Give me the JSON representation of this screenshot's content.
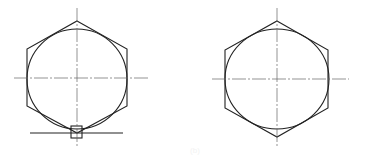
{
  "figure": {
    "stroke_color": "#222222",
    "centerline_color": "#555555",
    "background": "#ffffff",
    "left_view": {
      "label": "with tangent line and small square marker at bottom",
      "center": [
        77,
        77
      ],
      "has_bottom_line": true,
      "has_square_marker": true
    },
    "right_view": {
      "label": "plain hexagon with inscribed circle",
      "center": [
        277,
        79
      ],
      "has_bottom_line": false,
      "has_square_marker": false
    },
    "caption": "(b)"
  }
}
